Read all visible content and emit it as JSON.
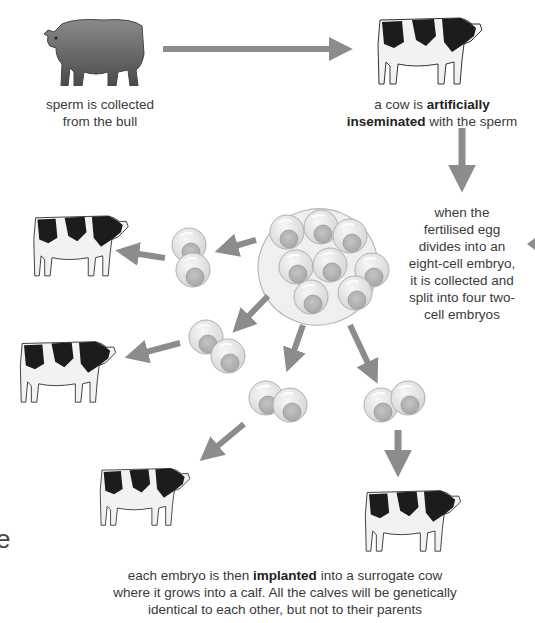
{
  "diagram": {
    "colors": {
      "arrow": "#8c8c8c",
      "text": "#3a3a3a",
      "cell_fill": "#e2e2e2",
      "nucleus_fill": "#b8b8b8",
      "embryo_ring": "#ededed",
      "bull": "#6e6e6e"
    },
    "nodes": {
      "bull": {
        "icon": "bull-icon",
        "caption_line1": "sperm is collected",
        "caption_line2": "from the bull"
      },
      "mother_cow": {
        "icon": "cow-icon",
        "caption_pre": "a cow is ",
        "caption_bold1": "artificially",
        "caption_bold2": "inseminated",
        "caption_post": " with the sperm"
      },
      "eight_cell_embryo": {
        "icon": "eight-cell-embryo-icon",
        "caption_lines": [
          "when the",
          "fertilised egg",
          "divides into an",
          "eight-cell embryo,",
          "it is collected and",
          "split into four two-",
          "cell embryos"
        ]
      },
      "two_cell_embryos": [
        {
          "icon": "two-cell-embryo-icon"
        },
        {
          "icon": "two-cell-embryo-icon"
        },
        {
          "icon": "two-cell-embryo-icon"
        },
        {
          "icon": "two-cell-embryo-icon"
        }
      ],
      "surrogate_cows": [
        {
          "icon": "cow-icon"
        },
        {
          "icon": "cow-icon"
        },
        {
          "icon": "cow-icon"
        },
        {
          "icon": "cow-icon"
        }
      ],
      "final": {
        "line1_pre": "each embryo is then ",
        "line1_bold": "implanted",
        "line1_post": " into a surrogate cow",
        "line2": "where it grows into a calf. All the calves will be genetically",
        "line3": "identical to each other, but not to their parents"
      }
    },
    "edge_fragments": {
      "left_letter": "e"
    }
  }
}
